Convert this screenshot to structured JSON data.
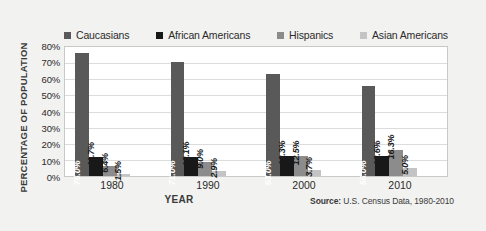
{
  "chart_data": {
    "type": "bar",
    "title": "",
    "xlabel": "YEAR",
    "ylabel": "PERCENTAGE OF POPULATION",
    "categories": [
      "1980",
      "1990",
      "2000",
      "2010"
    ],
    "ylim": [
      0,
      80
    ],
    "ytick_labels": [
      "0%",
      "10%",
      "20%",
      "30%",
      "40%",
      "50%",
      "60%",
      "70%",
      "80%"
    ],
    "ytick_values": [
      0,
      10,
      20,
      30,
      40,
      50,
      60,
      70,
      80
    ],
    "grid": true,
    "legend_position": "top",
    "value_suffix": "%",
    "series": [
      {
        "name": "Caucasians",
        "color": "#595959",
        "values": [
          76.0,
          71.0,
          63.0,
          56.0
        ],
        "labels": [
          "76.0%",
          "71.0%",
          "63.0%",
          "56.0%"
        ]
      },
      {
        "name": "African Americans",
        "color": "#181818",
        "values": [
          11.7,
          12.1,
          12.3,
          12.6
        ],
        "labels": [
          "11.7%",
          "12.1%",
          "12.3%",
          "12.6%"
        ]
      },
      {
        "name": "Hispanics",
        "color": "#8c8c8c",
        "values": [
          6.4,
          9.0,
          12.5,
          16.3
        ],
        "labels": [
          "6.4%",
          "9.0%",
          "12.5%",
          "16.3%"
        ]
      },
      {
        "name": "Asian Americans",
        "color": "#c4c4c4",
        "values": [
          1.5,
          2.9,
          3.7,
          5.0
        ],
        "labels": [
          "1.5%",
          "2.9%",
          "3.7%",
          "5.0%"
        ]
      }
    ]
  },
  "source": {
    "label": "Source:",
    "text": " U.S. Census Data, 1980-2010"
  }
}
